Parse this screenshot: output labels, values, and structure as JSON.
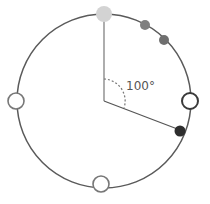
{
  "diagram": {
    "angle_label": "100°",
    "colors": {
      "circle_stroke": "#5a5a5a",
      "top_dot": "#d3d3d3",
      "gray_dot": "#7a7a7a",
      "dark_dot": "#2e2e2e",
      "open_dot_fill": "#ffffff"
    },
    "points": [
      {
        "name": "top",
        "style": "filled-light"
      },
      {
        "name": "upper-right-1",
        "style": "filled-gray"
      },
      {
        "name": "upper-right-2",
        "style": "filled-gray"
      },
      {
        "name": "right",
        "style": "open-dark"
      },
      {
        "name": "lower-right",
        "style": "filled-dark"
      },
      {
        "name": "bottom",
        "style": "open-gray"
      },
      {
        "name": "left",
        "style": "open-gray"
      }
    ]
  }
}
